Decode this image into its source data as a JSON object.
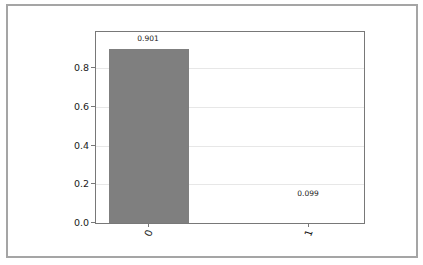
{
  "figure": {
    "background": "#ffffff",
    "border_color": "#a5a5a5"
  },
  "chart_data": {
    "type": "bar",
    "title": "",
    "categories": [
      "0",
      "1"
    ],
    "values": [
      0.901,
      0.099
    ],
    "bar_labels": [
      "0.901",
      "0.099"
    ],
    "xlabel": "",
    "ylabel": "Quasi-probability",
    "ylim": [
      0,
      0.987
    ],
    "yticks": [
      0,
      0.2,
      0.4,
      0.6,
      0.8
    ],
    "ytick_labels": [
      "0.0",
      "0.2",
      "0.4",
      "0.6",
      "0.8"
    ],
    "xtick_rotation_deg": 70,
    "grid": true,
    "legend": null,
    "bar_color": "#7f7f7f",
    "grid_color": "#e7e7e7",
    "spine_color": "#787878",
    "text_color": "#1a1a1a"
  }
}
